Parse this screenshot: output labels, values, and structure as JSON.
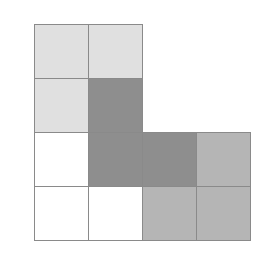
{
  "diagram": {
    "origin": {
      "x": 34,
      "y": 24
    },
    "cell_size": 54,
    "border_color": "#8a8a8a",
    "palette": {
      "light": "#e0e0e0",
      "dark": "#8e8e8e",
      "medium": "#b5b5b5",
      "white": "#ffffff"
    },
    "cells": [
      {
        "row": 0,
        "col": 0,
        "shade": "light"
      },
      {
        "row": 0,
        "col": 1,
        "shade": "light"
      },
      {
        "row": 1,
        "col": 0,
        "shade": "light"
      },
      {
        "row": 1,
        "col": 1,
        "shade": "dark"
      },
      {
        "row": 2,
        "col": 0,
        "shade": "white"
      },
      {
        "row": 2,
        "col": 1,
        "shade": "dark"
      },
      {
        "row": 2,
        "col": 2,
        "shade": "dark"
      },
      {
        "row": 2,
        "col": 3,
        "shade": "medium"
      },
      {
        "row": 3,
        "col": 0,
        "shade": "white"
      },
      {
        "row": 3,
        "col": 1,
        "shade": "white"
      },
      {
        "row": 3,
        "col": 2,
        "shade": "medium"
      },
      {
        "row": 3,
        "col": 3,
        "shade": "medium"
      }
    ]
  }
}
